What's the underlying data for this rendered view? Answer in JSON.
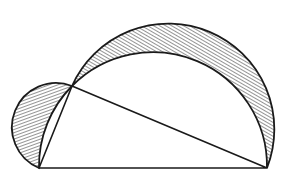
{
  "diagram": {
    "title": "Lunes of Hippocrates",
    "stroke_color": "#1a1a1a",
    "hatch_color": "#2a2a2a",
    "background": "#ffffff",
    "points": {
      "A": [
        39,
        168
      ],
      "B": [
        267,
        168
      ],
      "C": [
        72,
        86
      ]
    },
    "triangle": [
      "A",
      "B",
      "C"
    ],
    "circles": {
      "on_AB": {
        "center": [
          153,
          168
        ],
        "r": 114,
        "role": "inner arc (circumcircle half)"
      },
      "on_AC": {
        "center": [
          55.5,
          127
        ],
        "r": 44.2,
        "role": "small semicircle"
      },
      "on_CB": {
        "center": [
          169.5,
          127
        ],
        "r": 105.8,
        "role": "large semicircle"
      }
    },
    "shaded_regions": [
      "small lune on AC",
      "large lune on CB"
    ],
    "hatch": "diagonal lines"
  }
}
